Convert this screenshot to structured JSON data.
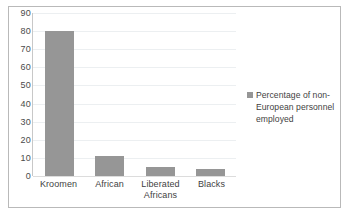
{
  "chart_data": {
    "type": "bar",
    "title": "",
    "xlabel": "",
    "ylabel": "",
    "categories": [
      "Kroomen",
      "African",
      "Liberated Africans",
      "Blacks"
    ],
    "values": [
      80,
      11,
      5,
      4
    ],
    "series": [
      {
        "name": "Percentage of non-European personnel employed",
        "values": [
          80,
          11,
          5,
          4
        ]
      }
    ],
    "ylim": [
      0,
      90
    ],
    "ytick_step": 10,
    "yticks": [
      "90",
      "80",
      "70",
      "60",
      "50",
      "40",
      "30",
      "20",
      "10",
      "0"
    ],
    "grid": true,
    "legend_position": "right",
    "legend": [
      {
        "label": "Percentage of non-European personnel employed",
        "color": "#969696"
      }
    ],
    "colors": {
      "bar": "#969696",
      "gridline": "#eceff1",
      "axis": "#c8c8c8",
      "frame": "#b9b9b9",
      "text": "#3f3f3f",
      "background": "#ffffff"
    }
  }
}
